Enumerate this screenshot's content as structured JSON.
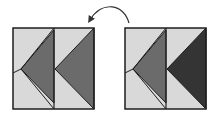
{
  "diagram": {
    "colors": {
      "light": "#d9d9d9",
      "medium": "#6b6b6b",
      "dark": "#343434",
      "stroke": "#1e1e1e",
      "arrow": "#333333"
    },
    "blocks": [
      {
        "name": "left-block",
        "x": 13,
        "y": 28,
        "size": 81,
        "right_triangle_fill": "medium"
      },
      {
        "name": "right-block",
        "x": 125,
        "y": 28,
        "size": 81,
        "right_triangle_fill": "dark"
      }
    ],
    "arrow": {
      "from": "right-block",
      "to": "left-block",
      "direction": "counter-clockwise"
    }
  }
}
